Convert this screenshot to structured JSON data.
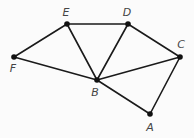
{
  "diagram": {
    "type": "undirected-graph",
    "nodes": [
      {
        "id": "A",
        "label": "A",
        "x": 150,
        "y": 114,
        "label_x": 150,
        "label_y": 128
      },
      {
        "id": "B",
        "label": "B",
        "x": 97,
        "y": 80,
        "label_x": 95,
        "label_y": 93
      },
      {
        "id": "C",
        "label": "C",
        "x": 180,
        "y": 57,
        "label_x": 181,
        "label_y": 45
      },
      {
        "id": "D",
        "label": "D",
        "x": 128,
        "y": 24,
        "label_x": 127,
        "label_y": 13
      },
      {
        "id": "E",
        "label": "E",
        "x": 67,
        "y": 24,
        "label_x": 66,
        "label_y": 13
      },
      {
        "id": "F",
        "label": "F",
        "x": 14,
        "y": 57,
        "label_x": 13,
        "label_y": 69
      }
    ],
    "edges": [
      {
        "from": "E",
        "to": "D"
      },
      {
        "from": "E",
        "to": "F"
      },
      {
        "from": "E",
        "to": "B"
      },
      {
        "from": "D",
        "to": "B"
      },
      {
        "from": "D",
        "to": "C"
      },
      {
        "from": "C",
        "to": "B"
      },
      {
        "from": "C",
        "to": "A"
      },
      {
        "from": "B",
        "to": "F"
      },
      {
        "from": "B",
        "to": "A"
      }
    ],
    "colors": {
      "edge": "#1a1a1a",
      "node": "#111111",
      "label": "#444444",
      "background": "#fbfbfb"
    }
  }
}
